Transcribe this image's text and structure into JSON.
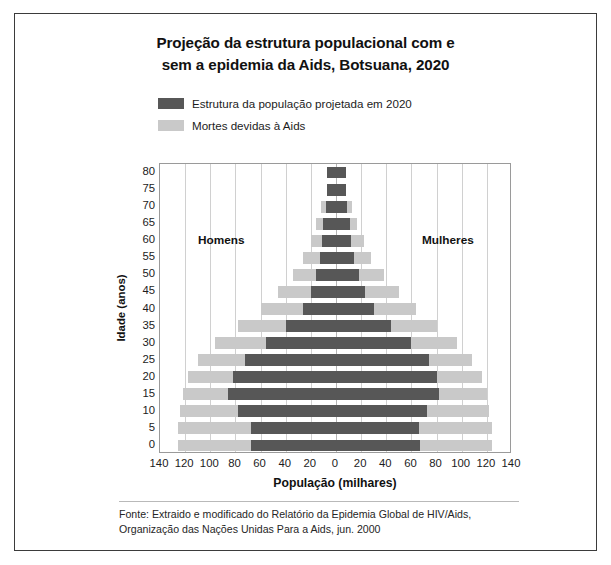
{
  "title": {
    "line1": "Projeção da estrutura populacional com e",
    "line2": "sem a epidemia da Aids, Botsuana, 2020"
  },
  "legend": {
    "position": "top-center",
    "items": [
      {
        "label": "Estrutura da população projetada em 2020",
        "color": "#575757",
        "icon": "legend-swatch-dark"
      },
      {
        "label": "Mortes devidas à Aids",
        "color": "#c9c9c9",
        "icon": "legend-swatch-light"
      }
    ]
  },
  "side_labels": {
    "left": "Homens",
    "right": "Mulheres"
  },
  "axes": {
    "x_title": "População (milhares)",
    "y_title": "Idade (anos)",
    "x_ticks": [
      "140",
      "120",
      "100",
      "80",
      "60",
      "40",
      "20",
      "0",
      "20",
      "40",
      "60",
      "80",
      "100",
      "120",
      "140"
    ],
    "y_ticks": [
      "80",
      "75",
      "70",
      "65",
      "60",
      "55",
      "50",
      "45",
      "40",
      "35",
      "30",
      "25",
      "20",
      "15",
      "10",
      "5",
      "0"
    ]
  },
  "source": {
    "line1": "Fonte: Extraido e modificado do Relatório da Epidemia Global de HIV/Aids,",
    "line2": "Organização das Nações Unidas Para a Aids, jun. 2000"
  },
  "chart_data": {
    "type": "bar",
    "subtype": "population-pyramid",
    "title": "Projeção da estrutura populacional com e sem a epidemia da Aids, Botsuana, 2020",
    "xlabel": "População (milhares)",
    "ylabel": "Idade (anos)",
    "xlim": [
      -140,
      140
    ],
    "xtick_step": 20,
    "grid": true,
    "legend": [
      "Estrutura da população projetada em 2020",
      "Mortes devidas à Aids"
    ],
    "categories": [
      "0",
      "5",
      "10",
      "15",
      "20",
      "25",
      "30",
      "35",
      "40",
      "45",
      "50",
      "55",
      "60",
      "65",
      "70",
      "75",
      "80"
    ],
    "series": [
      {
        "name": "Estrutura da população projetada em 2020",
        "color": "#575757",
        "males": [
          68,
          68,
          78,
          86,
          82,
          72,
          56,
          40,
          26,
          20,
          16,
          13,
          11,
          10,
          8,
          7,
          7
        ],
        "females": [
          67,
          66,
          72,
          82,
          80,
          74,
          60,
          44,
          30,
          23,
          18,
          14,
          12,
          11,
          9,
          8,
          8
        ]
      },
      {
        "name": "Mortes devidas à Aids",
        "color": "#c9c9c9",
        "males": [
          126,
          126,
          124,
          122,
          118,
          110,
          96,
          78,
          60,
          46,
          34,
          26,
          20,
          16,
          12,
          7,
          7
        ],
        "females": [
          124,
          124,
          122,
          120,
          116,
          108,
          96,
          80,
          64,
          50,
          38,
          28,
          22,
          17,
          13,
          8,
          8
        ]
      }
    ]
  }
}
